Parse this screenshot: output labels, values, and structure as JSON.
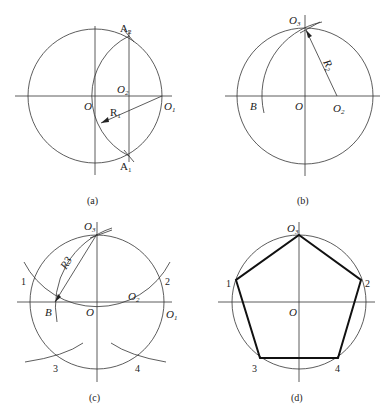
{
  "panels": {
    "a": {
      "caption": "(a)",
      "labels": {
        "O": "O",
        "O1": "O",
        "O1_sub": "1",
        "O2": "O",
        "O2_sub": "2",
        "A1": "A",
        "A1_sub": "1",
        "A2": "A",
        "A2_sub": "2",
        "R1": "R",
        "R1_sub": "1"
      }
    },
    "b": {
      "caption": "(b)",
      "labels": {
        "O": "O",
        "O2": "O",
        "O2_sub": "2",
        "O3": "O",
        "O3_sub": "3",
        "B": "B",
        "R2": "R",
        "R2_sub": "2"
      }
    },
    "c": {
      "caption": "(c)",
      "labels": {
        "O": "O",
        "O1": "O",
        "O1_sub": "1",
        "O2": "O",
        "O2_sub": "2",
        "O3": "O",
        "O3_sub": "3",
        "B": "B",
        "R3": "R3",
        "p1": "1",
        "p2": "2",
        "p3": "3",
        "p4": "4"
      }
    },
    "d": {
      "caption": "(d)",
      "labels": {
        "O": "O",
        "O3": "O",
        "O3_sub": "3",
        "p1": "1",
        "p2": "2",
        "p3": "3",
        "p4": "4"
      }
    }
  }
}
